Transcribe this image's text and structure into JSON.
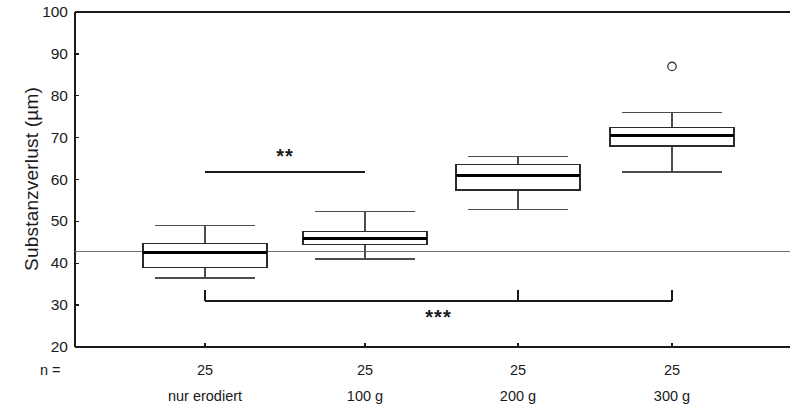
{
  "chart_data": {
    "type": "box",
    "title": "",
    "xlabel": "",
    "ylabel": "Substanzverlust (µm)",
    "ylim": [
      20,
      100
    ],
    "yticks": [
      20,
      30,
      40,
      50,
      60,
      70,
      80,
      90,
      100
    ],
    "ytick_labels": [
      "20",
      "30",
      "40",
      "50",
      "60",
      "70",
      "80",
      "90",
      "100"
    ],
    "grid": false,
    "legend": "none",
    "n_label": "n =",
    "categories": [
      "nur erodiert",
      "100 g",
      "200 g",
      "300 g"
    ],
    "n_values": [
      "25",
      "25",
      "25",
      "25"
    ],
    "reference_line": {
      "value": 42.8,
      "label": ""
    },
    "boxes": [
      {
        "category": "nur erodiert",
        "n": "25",
        "whisker_low": 36.5,
        "q1": 39.0,
        "median": 42.5,
        "q3": 44.8,
        "whisker_high": 49.0,
        "outliers": []
      },
      {
        "category": "100 g",
        "n": "25",
        "whisker_low": 41.0,
        "q1": 44.5,
        "median": 46.0,
        "q3": 47.5,
        "whisker_high": 52.3,
        "outliers": []
      },
      {
        "category": "200 g",
        "n": "25",
        "whisker_low": 52.8,
        "q1": 57.5,
        "median": 61.0,
        "q3": 63.5,
        "whisker_high": 65.5,
        "outliers": []
      },
      {
        "category": "300 g",
        "n": "25",
        "whisker_low": 61.8,
        "q1": 68.0,
        "median": 70.5,
        "q3": 72.5,
        "whisker_high": 76.0,
        "outliers": [
          87.0
        ]
      }
    ],
    "significance_bars": [
      {
        "label": "**",
        "from_category": "nur erodiert",
        "to_category": "100 g",
        "y": 61.8,
        "label_y": 65.0,
        "has_end_ticks": false
      },
      {
        "label": "***",
        "from_category": "nur erodiert",
        "to_category": "300 g",
        "y": 30.9,
        "label_y": 26.5,
        "has_end_ticks": true
      }
    ],
    "colors": {
      "axis": "#1a1a1a",
      "box_outline": "#2b2b2b",
      "median": "#000000",
      "whisker": "#4d4d4d",
      "reference_line": "#707070",
      "outlier": "#333333",
      "background": "#ffffff"
    }
  }
}
